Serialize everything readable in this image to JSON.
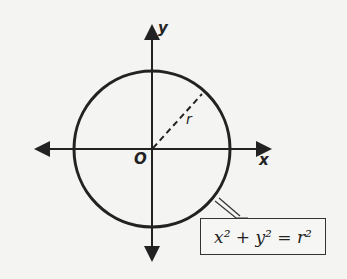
{
  "diagram": {
    "title": "",
    "axes": {
      "x_label": "x",
      "y_label": "y",
      "origin_label": "O"
    },
    "circle": {
      "center": [
        152,
        150
      ],
      "radius_px": 78,
      "radius_label": "r"
    },
    "equation": "x² + y² = r²",
    "colors": {
      "stroke": "#222222",
      "background": "#f4f4f2"
    }
  }
}
